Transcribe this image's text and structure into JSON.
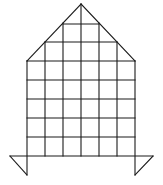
{
  "figure": {
    "stroke_color": "#1a1a1a",
    "background": "#ffffff",
    "grid": {
      "columns_x": [
        27,
        45,
        63,
        81,
        99,
        117,
        135
      ],
      "rows_y": [
        61,
        80,
        99,
        118,
        137,
        156
      ],
      "body_cells": "6 columns x 5 rows"
    },
    "roof": {
      "apex": [
        81,
        4
      ],
      "left_base": [
        27,
        61
      ],
      "right_base": [
        135,
        61
      ],
      "inner_rows": [
        {
          "y": 24,
          "x1": 63,
          "x2": 99
        },
        {
          "y": 42,
          "x1": 45,
          "x2": 117
        }
      ]
    },
    "base_bar": {
      "y": 156,
      "x1": 10,
      "x2": 153
    },
    "feet": {
      "left": {
        "outer": [
          10,
          156
        ],
        "tip": [
          27,
          175
        ]
      },
      "right": {
        "outer": [
          153,
          156
        ],
        "tip": [
          135,
          175
        ]
      }
    }
  }
}
